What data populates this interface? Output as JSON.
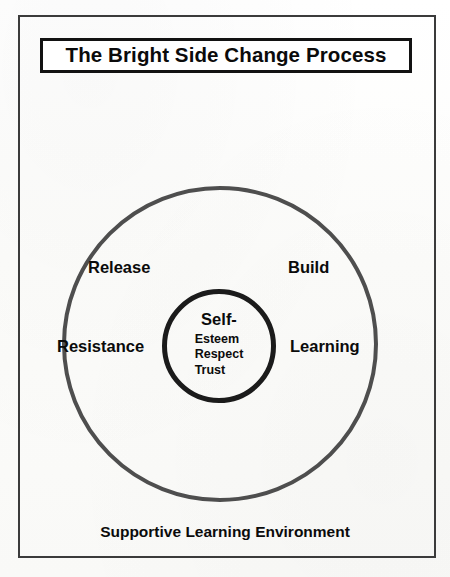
{
  "diagram": {
    "title": "The Bright Side Change Process",
    "caption": "Supportive Learning Environment",
    "rings": {
      "outer": {
        "name": "outer-ring",
        "stroke_color": "#4e4e4e",
        "labels": [
          {
            "id": "release",
            "text": "Release",
            "position": "upper-left"
          },
          {
            "id": "build",
            "text": "Build",
            "position": "upper-right"
          },
          {
            "id": "resistance",
            "text": "Resistance",
            "position": "mid-left"
          },
          {
            "id": "learning",
            "text": "Learning",
            "position": "mid-right"
          }
        ]
      },
      "inner": {
        "name": "inner-core",
        "stroke_color": "#1b1b1b",
        "primary": "Self-",
        "items": [
          "Esteem",
          "Respect",
          "Trust"
        ]
      }
    }
  },
  "colors": {
    "page_background": "#fdfdfb",
    "frame_border": "#3b3b3b",
    "title_border": "#121212",
    "text": "#0b0b0b"
  }
}
